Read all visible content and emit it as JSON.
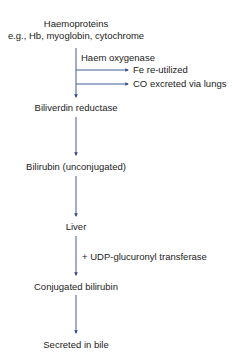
{
  "diagram": {
    "nodes": {
      "haemoproteins": "Haemoproteins",
      "haemoproteins_examples": "e.g., Hb, myoglobin, cytochrome",
      "biliverdin_reductase": "Biliverdin reductase",
      "bilirubin_unconjugated": "Bilirubin (unconjugated)",
      "liver": "Liver",
      "conjugated_bilirubin": "Conjugated bilirubin",
      "secreted_in_bile": "Secreted in bile"
    },
    "edge_labels": {
      "haem_oxygenase": "Haem oxygenase",
      "udp_transferase": "+ UDP-glucuronyl transferase"
    },
    "side_outputs": {
      "fe": "Fe re-utilized",
      "co": "CO excreted via lungs"
    },
    "colors": {
      "arrow": "#2b4a8a",
      "text": "#222222"
    }
  }
}
